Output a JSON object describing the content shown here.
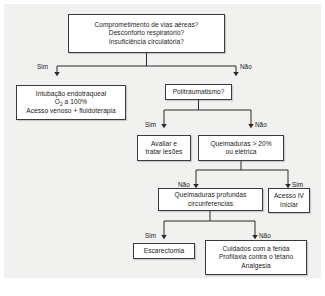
{
  "figure": {
    "background_color": "#f1f1ef",
    "box_border_color": "#3a3a3a",
    "box_fill_color": "#ffffff",
    "text_color": "#1b1b1b",
    "caption": ""
  },
  "nodes": {
    "airway": {
      "id": "airway-assessment",
      "lines": [
        "Comprometimento de vias aéreas?",
        "Desconforto respiratório?",
        "Insuficiência circulatória?"
      ]
    },
    "intubation": {
      "id": "intubation-treatment",
      "lines": [
        "Intubação endotraqueal",
        "O2 a 100%",
        "Acesso venoso + fluidoterapia"
      ],
      "line2_prefix": "O",
      "line2_sub": "2",
      "line2_suffix": " a 100%"
    },
    "polytrauma": {
      "id": "polytrauma-question",
      "lines": [
        "Politraumatismo?"
      ]
    },
    "evaluate": {
      "id": "evaluate-treat-lesions",
      "lines": [
        "Avaliar e",
        "tratar lesões"
      ]
    },
    "burns20": {
      "id": "burns-over-20-percent",
      "lines": [
        "Queimaduras > 20%",
        "ou elétrica"
      ]
    },
    "deepburns": {
      "id": "deep-circumferential-burns",
      "lines": [
        "Queimaduras profundas",
        "circunferencias"
      ]
    },
    "ivaccess": {
      "id": "iv-access-start",
      "lines": [
        "Acesso IV",
        "Iniciar"
      ]
    },
    "escharotomy": {
      "id": "escharotomy",
      "lines": [
        "Escarectomia"
      ]
    },
    "woundcare": {
      "id": "wound-care",
      "lines": [
        "Cuidados com a ferida",
        "Profilaxia contra o tétano",
        "Analgesia"
      ]
    }
  },
  "edge_labels": {
    "airway_yes": "Sim",
    "airway_no": "Não",
    "polytrauma_yes": "Sim",
    "polytrauma_no": "Não",
    "burns20_no": "Não",
    "burns20_yes": "Sim",
    "deepburns_yes": "Sim",
    "deepburns_no": "Não"
  }
}
